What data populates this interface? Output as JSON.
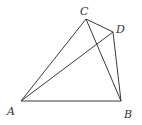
{
  "diagram": {
    "points": {
      "A": {
        "label": "A",
        "x": 21,
        "y": 101
      },
      "B": {
        "label": "B",
        "x": 121,
        "y": 101
      },
      "C": {
        "label": "C",
        "x": 86,
        "y": 19
      },
      "D": {
        "label": "D",
        "x": 113,
        "y": 32
      }
    },
    "segments": [
      "AB",
      "AC",
      "AD",
      "CB",
      "CD",
      "DB"
    ],
    "labels": {
      "A": "A",
      "B": "B",
      "C": "C",
      "D": "D"
    }
  }
}
